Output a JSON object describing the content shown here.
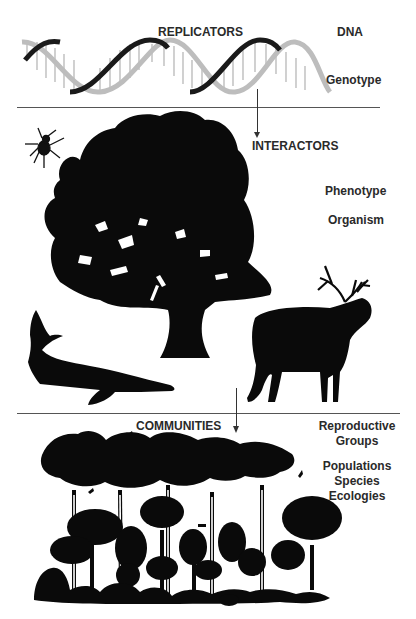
{
  "diagram": {
    "sections": [
      {
        "id": "replicators",
        "heading": "REPLICATORS",
        "side_labels": [
          "DNA",
          "Genotype"
        ],
        "illustration": "dna-double-helix"
      },
      {
        "id": "interactors",
        "heading": "INTERACTORS",
        "side_labels": [
          "Phenotype",
          "Organism"
        ],
        "illustration": [
          "spider",
          "oak-tree",
          "sturgeon-fish",
          "elk"
        ]
      },
      {
        "id": "communities",
        "heading": "COMMUNITIES",
        "side_labels": [
          "Reproductive",
          "Groups",
          "Populations",
          "Species",
          "Ecologies"
        ],
        "illustration": "rainforest-canopy"
      }
    ],
    "arrows": [
      {
        "from": "replicators",
        "to": "interactors"
      },
      {
        "from": "interactors",
        "to": "communities"
      }
    ],
    "colors": {
      "silhouette": "#0a0a0a",
      "helix_dark": "#1a1a1a",
      "helix_light": "#bdbdbd",
      "text": "#2a2a2a",
      "rule": "#555555"
    }
  }
}
